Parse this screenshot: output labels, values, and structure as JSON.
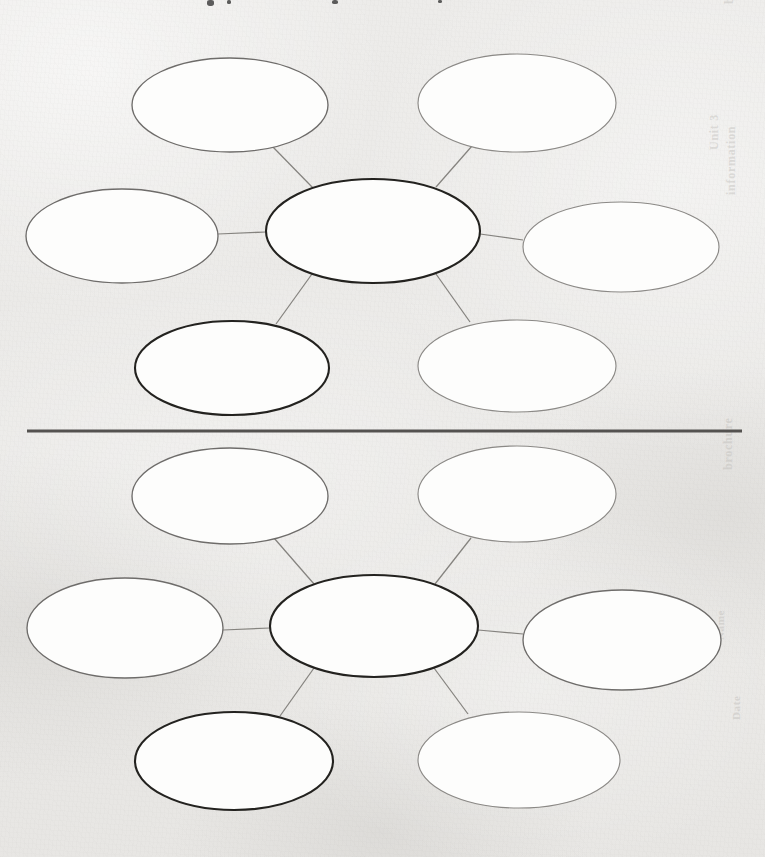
{
  "page": {
    "background_color": "#edecea",
    "width": 765,
    "height": 857
  },
  "divider": {
    "name": "horizontal-rule",
    "color": "#545250",
    "x1": 27,
    "y1": 431,
    "x2": 742,
    "y2": 431,
    "thickness": 3
  },
  "marginalia": {
    "top_edge_marks": [
      {
        "x": 207,
        "y": 0,
        "w": 7,
        "h": 6
      },
      {
        "x": 227,
        "y": 0,
        "w": 4,
        "h": 4
      },
      {
        "x": 332,
        "y": 0,
        "w": 6,
        "h": 4
      },
      {
        "x": 438,
        "y": 0,
        "w": 4,
        "h": 3
      }
    ],
    "bleed_through": [
      {
        "text": "brochure",
        "x": 737,
        "y": 4,
        "size": 13,
        "vertical": true
      },
      {
        "text": "Unit 3",
        "x": 722,
        "y": 150,
        "size": 12,
        "vertical": true
      },
      {
        "text": "information",
        "x": 739,
        "y": 195,
        "size": 12,
        "vertical": true
      },
      {
        "text": "brochure",
        "x": 736,
        "y": 470,
        "size": 12,
        "vertical": true
      },
      {
        "text": "Name",
        "x": 726,
        "y": 640,
        "size": 11,
        "vertical": true
      },
      {
        "text": "Date",
        "x": 742,
        "y": 720,
        "size": 11,
        "vertical": true
      }
    ]
  },
  "diagrams": [
    {
      "id": "concept-map-top",
      "name": "concept-map-top",
      "center": {
        "id": "center",
        "name": "center-oval",
        "cx": 373,
        "cy": 231,
        "rx": 107,
        "ry": 52,
        "style": "emphasis",
        "text": ""
      },
      "satellites": [
        {
          "id": "top-left",
          "name": "satellite-oval-top-left",
          "cx": 230,
          "cy": 105,
          "rx": 98,
          "ry": 47,
          "style": "normal",
          "text": ""
        },
        {
          "id": "top-right",
          "name": "satellite-oval-top-right",
          "cx": 517,
          "cy": 103,
          "rx": 99,
          "ry": 49,
          "style": "faint",
          "text": ""
        },
        {
          "id": "mid-left",
          "name": "satellite-oval-mid-left",
          "cx": 122,
          "cy": 236,
          "rx": 96,
          "ry": 47,
          "style": "normal",
          "text": ""
        },
        {
          "id": "mid-right",
          "name": "satellite-oval-mid-right",
          "cx": 621,
          "cy": 247,
          "rx": 98,
          "ry": 45,
          "style": "faint",
          "text": ""
        },
        {
          "id": "bottom-left",
          "name": "satellite-oval-bottom-left",
          "cx": 232,
          "cy": 368,
          "rx": 97,
          "ry": 47,
          "style": "emphasis",
          "text": ""
        },
        {
          "id": "bottom-right",
          "name": "satellite-oval-bottom-right",
          "cx": 517,
          "cy": 366,
          "rx": 99,
          "ry": 46,
          "style": "faint",
          "text": ""
        }
      ],
      "connectors": [
        {
          "name": "connector-center-to-top-left",
          "x1": 313,
          "y1": 188,
          "x2": 272,
          "y2": 146
        },
        {
          "name": "connector-center-to-top-right",
          "x1": 436,
          "y1": 187,
          "x2": 472,
          "y2": 146
        },
        {
          "name": "connector-center-to-mid-left",
          "x1": 266,
          "y1": 232,
          "x2": 218,
          "y2": 234
        },
        {
          "name": "connector-center-to-mid-right",
          "x1": 480,
          "y1": 234,
          "x2": 523,
          "y2": 240
        },
        {
          "name": "connector-center-to-bottom-left",
          "x1": 312,
          "y1": 274,
          "x2": 276,
          "y2": 324
        },
        {
          "name": "connector-center-to-bottom-right",
          "x1": 436,
          "y1": 274,
          "x2": 470,
          "y2": 322
        }
      ]
    },
    {
      "id": "concept-map-bottom",
      "name": "concept-map-bottom",
      "center": {
        "id": "center",
        "name": "center-oval",
        "cx": 374,
        "cy": 626,
        "rx": 104,
        "ry": 51,
        "style": "emphasis",
        "text": ""
      },
      "satellites": [
        {
          "id": "top-left",
          "name": "satellite-oval-top-left",
          "cx": 230,
          "cy": 496,
          "rx": 98,
          "ry": 48,
          "style": "normal",
          "text": ""
        },
        {
          "id": "top-right",
          "name": "satellite-oval-top-right",
          "cx": 517,
          "cy": 494,
          "rx": 99,
          "ry": 48,
          "style": "faint",
          "text": ""
        },
        {
          "id": "mid-left",
          "name": "satellite-oval-mid-left",
          "cx": 125,
          "cy": 628,
          "rx": 98,
          "ry": 50,
          "style": "normal",
          "text": ""
        },
        {
          "id": "mid-right",
          "name": "satellite-oval-mid-right",
          "cx": 622,
          "cy": 640,
          "rx": 99,
          "ry": 50,
          "style": "normal",
          "text": ""
        },
        {
          "id": "bottom-left",
          "name": "satellite-oval-bottom-left",
          "cx": 234,
          "cy": 761,
          "rx": 99,
          "ry": 49,
          "style": "emphasis",
          "text": ""
        },
        {
          "id": "bottom-right",
          "name": "satellite-oval-bottom-right",
          "cx": 519,
          "cy": 760,
          "rx": 101,
          "ry": 48,
          "style": "faint",
          "text": ""
        }
      ],
      "connectors": [
        {
          "name": "connector-center-to-top-left",
          "x1": 314,
          "y1": 584,
          "x2": 274,
          "y2": 538
        },
        {
          "name": "connector-center-to-top-right",
          "x1": 435,
          "y1": 584,
          "x2": 471,
          "y2": 538
        },
        {
          "name": "connector-center-to-mid-left",
          "x1": 270,
          "y1": 628,
          "x2": 223,
          "y2": 630
        },
        {
          "name": "connector-center-to-mid-right",
          "x1": 478,
          "y1": 630,
          "x2": 523,
          "y2": 634
        },
        {
          "name": "connector-center-to-bottom-left",
          "x1": 314,
          "y1": 668,
          "x2": 280,
          "y2": 716
        },
        {
          "name": "connector-center-to-bottom-right",
          "x1": 434,
          "y1": 668,
          "x2": 468,
          "y2": 714
        }
      ]
    }
  ]
}
